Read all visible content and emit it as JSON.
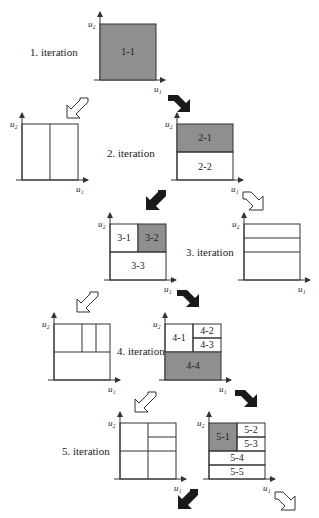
{
  "colors": {
    "shaded": "#8f8f8f",
    "line": "#333333",
    "arrow_filled": "#1a1a1a",
    "arrow_hollow": "#ffffff"
  },
  "axis_labels": {
    "x": "u₁",
    "y": "u₂"
  },
  "iterations": [
    {
      "label": "1. iteration",
      "cells": [
        "1-1"
      ],
      "shaded": "1-1"
    },
    {
      "label": "2. iteration",
      "cells": [
        "2-1",
        "2-2"
      ],
      "shaded": "2-1"
    },
    {
      "label": "3. iteration",
      "cells": [
        "3-1",
        "3-2",
        "3-3"
      ],
      "shaded": "3-2"
    },
    {
      "label": "4. iteration",
      "cells": [
        "4-1",
        "4-2",
        "4-3",
        "4-4"
      ],
      "shaded": "4-4"
    },
    {
      "label": "5. iteration",
      "cells": [
        "5-1",
        "5-2",
        "5-3",
        "5-4",
        "5-5"
      ],
      "shaded": "5-1"
    }
  ],
  "arrows": {
    "filled": "accepted partition branch",
    "hollow": "rejected partition branch"
  }
}
